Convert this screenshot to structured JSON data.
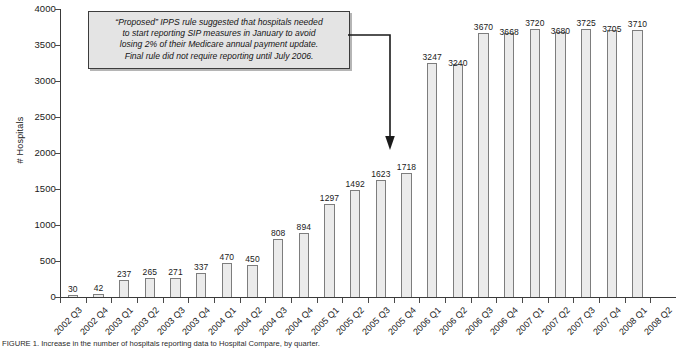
{
  "chart_data": {
    "type": "bar",
    "title": "",
    "xlabel": "",
    "ylabel": "# Hospitals",
    "ylim": [
      0,
      4000
    ],
    "ytick_step": 500,
    "yticks": [
      "4000",
      "3500",
      "3000",
      "2500",
      "2000",
      "1500",
      "1000",
      "500",
      "0"
    ],
    "grid": false,
    "legend": null,
    "bar_fill_color": "#ebebeb",
    "bar_edge_color": "#7d7d7d",
    "categories": [
      "2002 Q3",
      "2002 Q4",
      "2003 Q1",
      "2003 Q2",
      "2003 Q3",
      "2003 Q4",
      "2004 Q1",
      "2004 Q2",
      "2004 Q3",
      "2004 Q4",
      "2005 Q1",
      "2005 Q2",
      "2005 Q3",
      "2005 Q4",
      "2006 Q1",
      "2006 Q2",
      "2006 Q3",
      "2006 Q4",
      "2007 Q1",
      "2007 Q2",
      "2007 Q3",
      "2007 Q4",
      "2008 Q1",
      "2008 Q2"
    ],
    "values": [
      30,
      42,
      237,
      265,
      271,
      337,
      470,
      450,
      808,
      894,
      1297,
      1492,
      1623,
      1718,
      3247,
      3240,
      3670,
      3668,
      3720,
      3680,
      3725,
      3705,
      3710,
      null
    ],
    "annotations": [
      {
        "name": "ipps-rule-callout",
        "lines": [
          "“Proposed” IPPS rule suggested that hospitals needed",
          "to start reporting SIP measures in January to avoid",
          "losing 2% of their Medicare annual payment update.",
          "Final rule did not require reporting until July 2006."
        ],
        "points_to": "2006 Q1"
      }
    ]
  },
  "caption": {
    "text": "FIGURE 1. Increase in the number of hospitals reporting data to Hospital Compare, by quarter."
  }
}
